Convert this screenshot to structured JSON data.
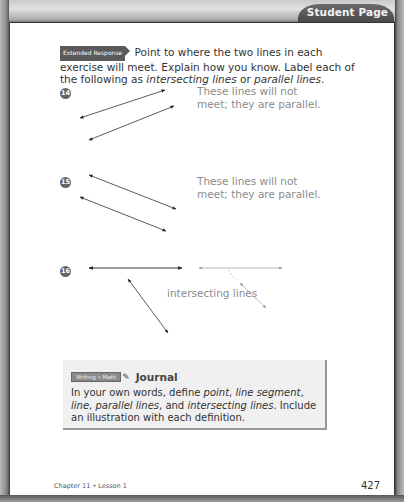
{
  "header": {
    "tab_label": "Student Page"
  },
  "intro": {
    "badge": "Extended Response",
    "text_1": "Point to where the two lines in each exercise will meet. Explain how you know. Label each of the following as ",
    "em_1": "intersecting lines",
    "text_2": " or ",
    "em_2": "parallel lines",
    "text_3": "."
  },
  "exercises": [
    {
      "number": "14",
      "answer_line_1": "These lines will not",
      "answer_line_2": "meet; they are parallel."
    },
    {
      "number": "15",
      "answer_line_1": "These lines will not",
      "answer_line_2": "meet; they are parallel."
    },
    {
      "number": "16",
      "answer": "intersecting lines"
    }
  ],
  "journal": {
    "badge": "Writing • Math",
    "title": "Journal",
    "t1": "In your own words, define ",
    "e1": "point",
    "t2": ", ",
    "e2": "line segment",
    "t3": ", ",
    "e3": "line",
    "t4": ", ",
    "e4": "parallel lines",
    "t5": ", and ",
    "e5": "intersecting lines",
    "t6": ". Include an illustration with each definition."
  },
  "footer": {
    "chapter": "Chapter 11 • Lesson 1",
    "page_number": "427"
  }
}
